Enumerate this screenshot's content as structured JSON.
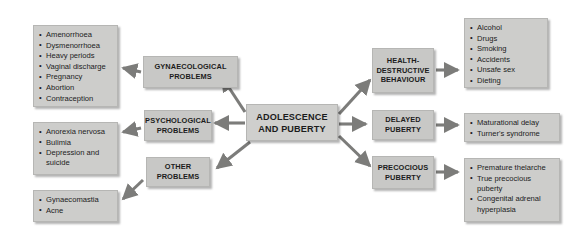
{
  "diagram": {
    "background_color": "#ffffff",
    "box_fill_color": "#c8c8c6",
    "box_border_color": "#b6b6b4",
    "arrow_color": "#7c7c7a",
    "text_color": "#1c1c1c",
    "center": {
      "label": "ADOLESCENCE\nAND PUBERTY"
    },
    "categories": {
      "gynaecological": "GYNAECOLOGICAL\nPROBLEMS",
      "psychological": "PSYCHOLOGICAL\nPROBLEMS",
      "other": "OTHER\nPROBLEMS",
      "health_destructive": "HEALTH-\nDESTRUCTIVE\nBEHAVIOUR",
      "delayed_puberty": "DELAYED\nPUBERTY",
      "precocious_puberty": "PRECOCIOUS\nPUBERTY"
    },
    "lists": {
      "gynaecological_items": [
        "Amenorrhoea",
        "Dysmenorrhoea",
        "Heavy periods",
        "Vaginal discharge",
        "Pregnancy",
        "Abortion",
        "Contraception"
      ],
      "psychological_items": [
        "Anorexia nervosa",
        "Bulimia",
        "Depression and\n   suicide"
      ],
      "other_items": [
        "Gynaecomastia",
        "Acne"
      ],
      "health_destructive_items": [
        "Alcohol",
        "Drugs",
        "Smoking",
        "Accidents",
        "Unsafe sex",
        "Dieting"
      ],
      "delayed_puberty_items": [
        "Maturational delay",
        "Turner's syndrome"
      ],
      "precocious_puberty_items": [
        "Premature thelarche",
        "True precocious\n   puberty",
        "Congenital adrenal\n   hyperplasia"
      ]
    }
  }
}
